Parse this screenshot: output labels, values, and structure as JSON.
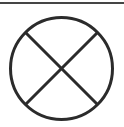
{
  "figure": {
    "background_color": "#ffffff",
    "top_rule": {
      "x1": 0,
      "x2": 124,
      "y": 3,
      "color": "#454545",
      "thickness": 2
    },
    "symbol": {
      "name": "crossed-circle",
      "stroke_color": "#2b2b2b",
      "stroke_width": 3,
      "center_x": 61.5,
      "center_y": 68.5,
      "radius": 51,
      "diagonal1": {
        "x1": 25.5,
        "y1": 32.5,
        "x2": 97.5,
        "y2": 104.5
      },
      "diagonal2": {
        "x1": 97.5,
        "y1": 32.5,
        "x2": 25.5,
        "y2": 104.5
      }
    }
  }
}
